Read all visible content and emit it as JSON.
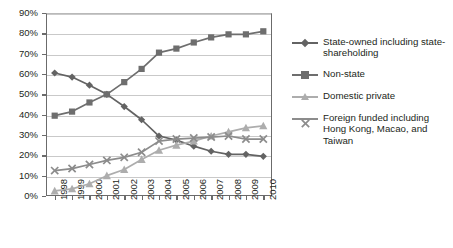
{
  "chart_data": {
    "type": "line",
    "title": "",
    "subtitle": "",
    "xlabel": "",
    "ylabel": "",
    "categories": [
      "1998",
      "1999",
      "2000",
      "2001",
      "2002",
      "2003",
      "2004",
      "2005",
      "2006",
      "2007",
      "2008",
      "2009",
      "2010"
    ],
    "x": [
      1998,
      1999,
      2000,
      2001,
      2002,
      2003,
      2004,
      2005,
      2006,
      2007,
      2008,
      2009,
      2010
    ],
    "ylim": [
      0,
      90
    ],
    "y_ticks": [
      "0%",
      "10%",
      "20%",
      "30%",
      "40%",
      "50%",
      "60%",
      "70%",
      "80%",
      "90%"
    ],
    "y_tick_values": [
      0,
      10,
      20,
      30,
      40,
      50,
      60,
      70,
      80,
      90
    ],
    "y_tick_suffix": "%",
    "grid": "horizontal",
    "legend_position": "right",
    "series": [
      {
        "name": "State-owned including state-shareholding",
        "marker": "diamond",
        "color": "#636363",
        "values": [
          60.5,
          58.5,
          54.5,
          50.0,
          44.0,
          37.5,
          29.5,
          27.5,
          24.5,
          22.0,
          20.5,
          20.5,
          19.5
        ]
      },
      {
        "name": "Non-state",
        "marker": "square",
        "color": "#6e6e6e",
        "values": [
          39.5,
          41.5,
          46.0,
          50.0,
          56.0,
          62.5,
          70.5,
          72.5,
          75.5,
          78.0,
          79.5,
          79.5,
          81.0
        ]
      },
      {
        "name": "Domestic private",
        "marker": "triangle",
        "color": "#adadad",
        "values": [
          2.5,
          3.5,
          6.0,
          10.0,
          13.0,
          18.0,
          22.5,
          25.0,
          27.0,
          29.5,
          31.5,
          33.5,
          34.5
        ]
      },
      {
        "name": "Foreign funded including Hong Kong, Macao, and Taiwan",
        "marker": "x",
        "color": "#8c8c8c",
        "values": [
          12.5,
          13.5,
          15.5,
          17.5,
          19.0,
          21.5,
          27.0,
          28.0,
          28.5,
          29.0,
          29.5,
          28.0,
          28.0
        ]
      }
    ]
  },
  "legend": {
    "items": [
      {
        "label": "State-owned including state-shareholding",
        "marker": "diamond-marker",
        "color": "#636363"
      },
      {
        "label": "Non-state",
        "marker": "square-marker",
        "color": "#6e6e6e"
      },
      {
        "label": "Domestic private",
        "marker": "triangle-marker",
        "color": "#adadad"
      },
      {
        "label": "Foreign funded including Hong Kong, Macao, and Taiwan",
        "marker": "x-marker",
        "color": "#8c8c8c"
      }
    ]
  },
  "axes": {
    "y_labels": [
      "90%",
      "80%",
      "70%",
      "60%",
      "50%",
      "40%",
      "30%",
      "20%",
      "10%",
      "0%"
    ],
    "x_labels": [
      "1998",
      "1999",
      "2000",
      "2001",
      "2002",
      "2003",
      "2004",
      "2005",
      "2006",
      "2007",
      "2008",
      "2009",
      "2010"
    ]
  },
  "colors": {
    "axis": "#6b6b6b",
    "grid": "#c9c9c9",
    "text": "#231f20",
    "background": "#ffffff"
  }
}
